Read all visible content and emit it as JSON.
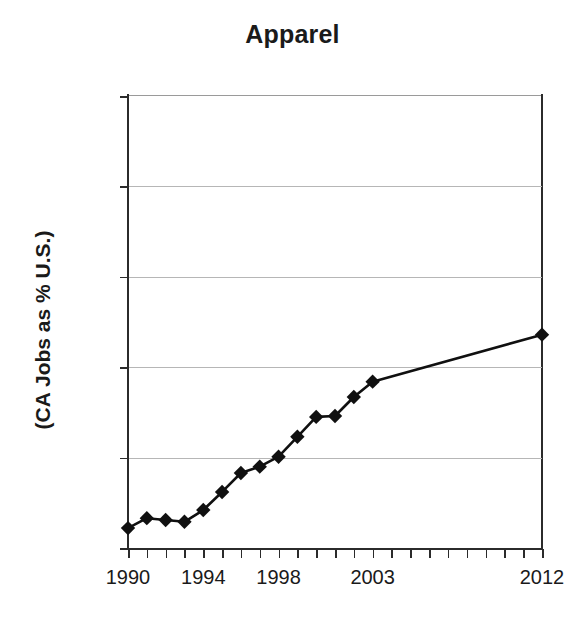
{
  "chart_data": {
    "type": "line",
    "title": "Apparel",
    "xlabel": "",
    "ylabel": "(CA Jobs as % U.S.)",
    "ylim": [
      10,
      60
    ],
    "xlim": [
      1990,
      2012
    ],
    "grid": true,
    "legend": false,
    "marker": "filled-diamond",
    "y_tick_labels": [
      "10%",
      "20%",
      "30%",
      "40%",
      "50%",
      "60%"
    ],
    "y_tick_values": [
      10,
      20,
      30,
      40,
      50,
      60
    ],
    "x_tick_labels": [
      "1990",
      "1994",
      "1998",
      "2003",
      "2012"
    ],
    "x_tick_values": [
      1990,
      1994,
      1998,
      2003,
      2012
    ],
    "x_minor_ticks": [
      1990,
      1991,
      1992,
      1993,
      1994,
      1995,
      1996,
      1997,
      1998,
      1999,
      2000,
      2001,
      2002,
      2003,
      2004,
      2005,
      2006,
      2007,
      2008,
      2009,
      2010,
      2011,
      2012
    ],
    "series": [
      {
        "name": "CA Jobs as % U.S.",
        "x": [
          1990,
          1991,
          1992,
          1993,
          1994,
          1995,
          1996,
          1997,
          1998,
          1999,
          2000,
          2001,
          2002,
          2003,
          2012
        ],
        "values": [
          12.2,
          13.3,
          13.1,
          12.9,
          14.2,
          16.2,
          18.3,
          19.0,
          20.1,
          22.3,
          24.5,
          24.6,
          26.7,
          28.4,
          33.6
        ]
      }
    ],
    "colors": {
      "line": "#101010",
      "marker": "#101010",
      "grid": "#b6b6b6",
      "axis": "#2b2b2b",
      "text": "#1a1a1a",
      "background": "#ffffff"
    }
  }
}
